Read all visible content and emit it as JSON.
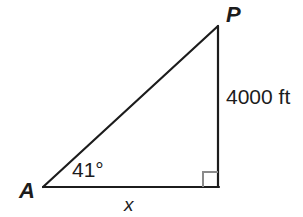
{
  "diagram": {
    "type": "right-triangle",
    "background_color": "#ffffff",
    "stroke_color": "#1c1c1c",
    "right_angle_color": "#8a8a8a",
    "vertices": {
      "apex_label": "P",
      "left_label": "A"
    },
    "angles": {
      "at_a": "41°",
      "at_right": "90°"
    },
    "sides": {
      "vertical_label": "4000 ft",
      "base_label": "x"
    },
    "geometry": {
      "a_x": 43,
      "a_y": 187,
      "p_x": 218,
      "p_y": 26,
      "b_x": 218,
      "b_y": 187,
      "right_angle_size": 15,
      "stroke_width": 2.2
    }
  }
}
